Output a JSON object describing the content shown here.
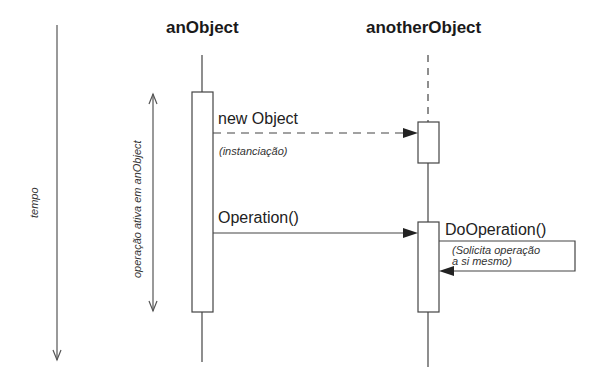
{
  "diagram": {
    "type": "sequence",
    "colors": {
      "line": "#444444",
      "text": "#222222",
      "background": "#ffffff"
    },
    "time_axis": {
      "label": "tempo"
    },
    "activation_annotation": {
      "label": "operação ativa em anObject"
    },
    "objects": [
      {
        "id": "anObject",
        "label": "anObject"
      },
      {
        "id": "anotherObject",
        "label": "anotherObject"
      }
    ],
    "messages": [
      {
        "from": "anObject",
        "to": "anotherObject",
        "label": "new Object",
        "note": "(instanciação)",
        "style": "dashed"
      },
      {
        "from": "anObject",
        "to": "anotherObject",
        "label": "Operation()",
        "style": "solid"
      },
      {
        "from": "anotherObject",
        "to": "anotherObject",
        "label": "DoOperation()",
        "note_line1": "(Solicita operação",
        "note_line2": "a si mesmo)",
        "style": "self"
      }
    ]
  }
}
